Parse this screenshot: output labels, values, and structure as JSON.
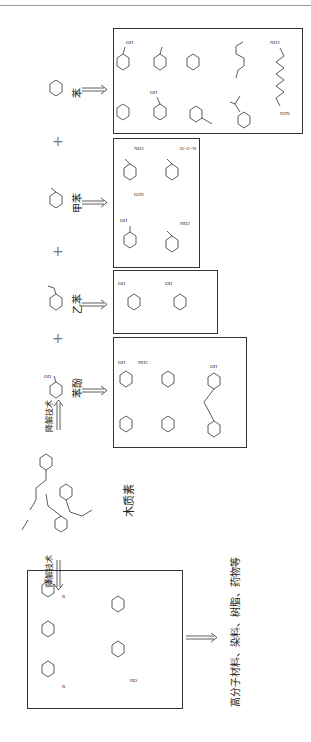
{
  "diagram": {
    "orientation": "rotated-90-ccw",
    "center": {
      "label": "木质素",
      "description": "lignin polymer structure"
    },
    "degradation": {
      "label_top": "降解技术",
      "label_bottom": "降解技术"
    },
    "feedstocks": [
      {
        "name": "苯",
        "structure": "benzene",
        "products": [
          "cyclohexanol",
          "cyclohexanone",
          "caprolactam",
          "adipic acid",
          "hexamethylenediamine",
          "cyclohexane",
          "phenol",
          "styrene",
          "cumene"
        ]
      },
      {
        "name": "甲苯",
        "structure": "toluene",
        "products": [
          "2,4-dinitrotoluene",
          "toluene diisocyanate",
          "benzoic acid",
          "2,4-diaminotoluene"
        ]
      },
      {
        "name": "乙苯",
        "structure": "ethylbenzene",
        "products": [
          "isophthalic acid",
          "terephthalic acid"
        ]
      },
      {
        "name": "苯酚",
        "structure": "phenol",
        "products": [
          "2-amino-4-aminophenol",
          "2-nitro-4-nitrophenol",
          "cyclohexanone",
          "cyclohexanol",
          "bisphenol A"
        ]
      }
    ],
    "plus_sign": "+",
    "monomers": {
      "products": [
        "4-alkylphenol",
        "4-alkylguaiacol",
        "4-alkylsyringol",
        "vanillin",
        "vanillic acid"
      ]
    },
    "final_products": "高分子材料、染料、树脂、药物等",
    "group_labels": {
      "OH": "OH",
      "NH2": "NH2",
      "NO2": "NO2",
      "O2N": "O2N",
      "H2N": "H2N",
      "HO": "HO",
      "O": "O",
      "R": "R",
      "NH": "NH",
      "NCO": "O=C=N"
    }
  }
}
